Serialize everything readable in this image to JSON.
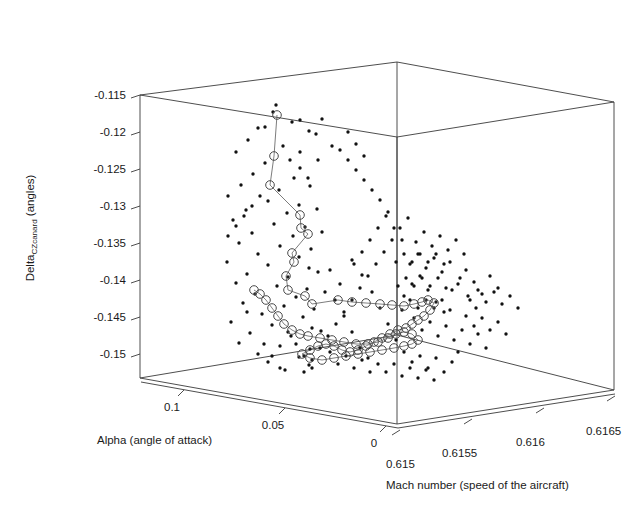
{
  "figure": {
    "kind": "3d-scatter-plot",
    "background": "#ffffff",
    "ink_color": "#1a1a1a"
  },
  "chart_data": {
    "type": "scatter",
    "title": "",
    "projection": "3d",
    "grid": false,
    "legend": null,
    "xlabel": "Alpha (angle of attack)",
    "ylabel": "Delta",
    "ylabel_sub": "CZcanard",
    "ylabel_suffix": " (angles)",
    "zlabel": "Mach number (speed of the aircraft)",
    "xticks": [
      "0.1",
      "0.05",
      "0"
    ],
    "xtick_values": [
      0.1,
      0.05,
      0
    ],
    "xlim": [
      0.1125,
      -0.0125
    ],
    "yticks": [
      "-0.115",
      "-0.12",
      "-0.125",
      "-0.13",
      "-0.135",
      "-0.14",
      "-0.145",
      "-0.15"
    ],
    "ytick_values": [
      -0.115,
      -0.12,
      -0.125,
      -0.13,
      -0.135,
      -0.14,
      -0.145,
      -0.15
    ],
    "ylim": [
      -0.1525,
      -0.1135
    ],
    "zticks": [
      "0.615",
      "0.6155",
      "0.616",
      "0.6165"
    ],
    "ztick_values": [
      0.615,
      0.6155,
      0.616,
      0.6165
    ],
    "zlim": [
      0.61488,
      0.61676
    ],
    "series": [
      {
        "name": "scatter-points",
        "marker": "small-filled-dot",
        "color": "#111111",
        "points_px": [
          [
            273,
            112
          ],
          [
            292,
            122
          ],
          [
            258,
            128
          ],
          [
            265,
            127
          ],
          [
            322,
            119
          ],
          [
            309,
            131
          ],
          [
            276,
            105
          ],
          [
            248,
            140
          ],
          [
            283,
            146
          ],
          [
            236,
            152
          ],
          [
            300,
            152
          ],
          [
            265,
            163
          ],
          [
            318,
            160
          ],
          [
            253,
            174
          ],
          [
            294,
            178
          ],
          [
            241,
            185
          ],
          [
            279,
            190
          ],
          [
            310,
            186
          ],
          [
            228,
            196
          ],
          [
            268,
            201
          ],
          [
            299,
            205
          ],
          [
            246,
            210
          ],
          [
            287,
            213
          ],
          [
            317,
            209
          ],
          [
            233,
            220
          ],
          [
            274,
            224
          ],
          [
            305,
            227
          ],
          [
            252,
            233
          ],
          [
            293,
            236
          ],
          [
            322,
            232
          ],
          [
            239,
            243
          ],
          [
            280,
            246
          ],
          [
            311,
            249
          ],
          [
            258,
            254
          ],
          [
            299,
            257
          ],
          [
            227,
            262
          ],
          [
            268,
            265
          ],
          [
            309,
            268
          ],
          [
            247,
            274
          ],
          [
            288,
            277
          ],
          [
            318,
            272
          ],
          [
            236,
            283
          ],
          [
            277,
            286
          ],
          [
            307,
            289
          ],
          [
            255,
            294
          ],
          [
            296,
            297
          ],
          [
            325,
            292
          ],
          [
            243,
            303
          ],
          [
            284,
            306
          ],
          [
            314,
            309
          ],
          [
            262,
            314
          ],
          [
            303,
            317
          ],
          [
            231,
            322
          ],
          [
            272,
            325
          ],
          [
            312,
            328
          ],
          [
            250,
            333
          ],
          [
            291,
            336
          ],
          [
            321,
            331
          ],
          [
            239,
            343
          ],
          [
            280,
            346
          ],
          [
            310,
            349
          ],
          [
            258,
            354
          ],
          [
            299,
            357
          ],
          [
            268,
            362
          ],
          [
            309,
            365
          ],
          [
            285,
            370
          ],
          [
            247,
            312
          ],
          [
            335,
            300
          ],
          [
            344,
            316
          ],
          [
            352,
            332
          ],
          [
            360,
            348
          ],
          [
            368,
            358
          ],
          [
            340,
            284
          ],
          [
            330,
            270
          ],
          [
            352,
            260
          ],
          [
            362,
            275
          ],
          [
            372,
            292
          ],
          [
            380,
            308
          ],
          [
            388,
            324
          ],
          [
            396,
            340
          ],
          [
            404,
            296
          ],
          [
            412,
            284
          ],
          [
            420,
            276
          ],
          [
            428,
            290
          ],
          [
            436,
            302
          ],
          [
            444,
            312
          ],
          [
            452,
            290
          ],
          [
            460,
            278
          ],
          [
            468,
            296
          ],
          [
            476,
            308
          ],
          [
            410,
            264
          ],
          [
            418,
            254
          ],
          [
            426,
            268
          ],
          [
            434,
            258
          ],
          [
            442,
            272
          ],
          [
            450,
            262
          ],
          [
            458,
            284
          ],
          [
            466,
            270
          ],
          [
            474,
            282
          ],
          [
            482,
            294
          ],
          [
            490,
            276
          ],
          [
            498,
            288
          ],
          [
            414,
            318
          ],
          [
            422,
            330
          ],
          [
            430,
            322
          ],
          [
            438,
            336
          ],
          [
            446,
            326
          ],
          [
            454,
            340
          ],
          [
            462,
            330
          ],
          [
            470,
            344
          ],
          [
            478,
            334
          ],
          [
            486,
            348
          ],
          [
            404,
            352
          ],
          [
            412,
            362
          ],
          [
            420,
            356
          ],
          [
            428,
            368
          ],
          [
            436,
            358
          ],
          [
            444,
            372
          ],
          [
            452,
            362
          ],
          [
            416,
            242
          ],
          [
            424,
            232
          ],
          [
            432,
            246
          ],
          [
            440,
            236
          ],
          [
            448,
            250
          ],
          [
            456,
            240
          ],
          [
            464,
            254
          ],
          [
            400,
            228
          ],
          [
            408,
            218
          ],
          [
            392,
            240
          ],
          [
            384,
            252
          ],
          [
            376,
            264
          ],
          [
            368,
            276
          ],
          [
            360,
            288
          ],
          [
            352,
            300
          ],
          [
            344,
            312
          ],
          [
            336,
            324
          ],
          [
            328,
            336
          ],
          [
            320,
            348
          ],
          [
            312,
            360
          ],
          [
            304,
            372
          ],
          [
            402,
            310
          ],
          [
            410,
            300
          ],
          [
            418,
            308
          ],
          [
            426,
            300
          ],
          [
            434,
            308
          ],
          [
            442,
            300
          ],
          [
            450,
            310
          ],
          [
            398,
            286
          ],
          [
            406,
            278
          ],
          [
            414,
            286
          ],
          [
            422,
            278
          ],
          [
            430,
            286
          ],
          [
            438,
            278
          ],
          [
            446,
            288
          ],
          [
            396,
            262
          ],
          [
            404,
            254
          ],
          [
            412,
            262
          ],
          [
            420,
            254
          ],
          [
            428,
            262
          ],
          [
            436,
            254
          ],
          [
            444,
            264
          ],
          [
            288,
            332
          ],
          [
            296,
            344
          ],
          [
            304,
            356
          ],
          [
            312,
            368
          ],
          [
            264,
            344
          ],
          [
            272,
            356
          ],
          [
            280,
            368
          ],
          [
            330,
            352
          ],
          [
            338,
            364
          ],
          [
            346,
            356
          ],
          [
            354,
            368
          ],
          [
            362,
            360
          ],
          [
            370,
            372
          ],
          [
            378,
            364
          ],
          [
            386,
            372
          ],
          [
            394,
            364
          ],
          [
            402,
            376
          ],
          [
            410,
            368
          ],
          [
            418,
            378
          ],
          [
            426,
            370
          ],
          [
            434,
            380
          ],
          [
            252,
            206
          ],
          [
            260,
            196
          ],
          [
            244,
            216
          ],
          [
            236,
            226
          ],
          [
            228,
            236
          ],
          [
            300,
            168
          ],
          [
            308,
            178
          ],
          [
            466,
            316
          ],
          [
            474,
            326
          ],
          [
            482,
            318
          ],
          [
            490,
            330
          ],
          [
            498,
            322
          ],
          [
            506,
            334
          ],
          [
            458,
            352
          ],
          [
            380,
            200
          ],
          [
            388,
            212
          ],
          [
            372,
            190
          ],
          [
            364,
            180
          ],
          [
            356,
            170
          ],
          [
            348,
            160
          ],
          [
            340,
            150
          ],
          [
            470,
            300
          ],
          [
            478,
            290
          ],
          [
            486,
            302
          ],
          [
            494,
            292
          ],
          [
            502,
            304
          ],
          [
            510,
            296
          ],
          [
            518,
            308
          ],
          [
            300,
            120
          ],
          [
            316,
            134
          ],
          [
            332,
            146
          ],
          [
            348,
            132
          ],
          [
            356,
            144
          ],
          [
            364,
            156
          ],
          [
            290,
            160
          ],
          [
            394,
            228
          ],
          [
            402,
            240
          ],
          [
            386,
            216
          ],
          [
            378,
            228
          ],
          [
            370,
            240
          ],
          [
            362,
            252
          ],
          [
            354,
            264
          ]
        ]
      },
      {
        "name": "trajectory-circles",
        "marker": "large-open-circle",
        "color": "#4a4a4a",
        "connected": true,
        "points_px": [
          [
            277,
            115
          ],
          [
            274,
            156
          ],
          [
            270,
            185
          ],
          [
            300,
            215
          ],
          [
            301,
            228
          ],
          [
            308,
            234
          ],
          [
            292,
            253
          ],
          [
            294,
            262
          ],
          [
            286,
            276
          ],
          [
            288,
            290
          ],
          [
            305,
            296
          ],
          [
            312,
            304
          ],
          [
            338,
            300
          ],
          [
            352,
            302
          ],
          [
            366,
            303
          ],
          [
            380,
            304
          ],
          [
            392,
            305
          ],
          [
            404,
            306
          ],
          [
            414,
            304
          ],
          [
            422,
            302
          ],
          [
            428,
            300
          ],
          [
            434,
            303
          ],
          [
            430,
            310
          ],
          [
            424,
            316
          ],
          [
            418,
            320
          ],
          [
            412,
            324
          ],
          [
            406,
            328
          ],
          [
            398,
            330
          ],
          [
            390,
            334
          ],
          [
            382,
            338
          ],
          [
            374,
            342
          ],
          [
            366,
            346
          ],
          [
            358,
            350
          ],
          [
            350,
            352
          ],
          [
            342,
            350
          ],
          [
            334,
            346
          ],
          [
            326,
            344
          ],
          [
            318,
            346
          ],
          [
            310,
            350
          ],
          [
            302,
            354
          ],
          [
            310,
            358
          ],
          [
            322,
            360
          ],
          [
            334,
            358
          ],
          [
            346,
            356
          ],
          [
            358,
            354
          ],
          [
            370,
            352
          ],
          [
            382,
            350
          ],
          [
            394,
            348
          ],
          [
            404,
            346
          ],
          [
            412,
            344
          ],
          [
            418,
            340
          ],
          [
            412,
            334
          ],
          [
            404,
            332
          ],
          [
            396,
            334
          ],
          [
            388,
            338
          ],
          [
            378,
            342
          ],
          [
            368,
            344
          ],
          [
            356,
            344
          ],
          [
            344,
            342
          ],
          [
            332,
            340
          ],
          [
            320,
            338
          ],
          [
            308,
            336
          ],
          [
            300,
            334
          ],
          [
            292,
            330
          ],
          [
            284,
            324
          ],
          [
            278,
            316
          ],
          [
            272,
            308
          ],
          [
            266,
            300
          ],
          [
            260,
            294
          ],
          [
            254,
            290
          ]
        ]
      }
    ]
  },
  "axes": {
    "y_label_main": "Delta",
    "y_label_subscript": "CZcanard",
    "y_label_tail": " (angles)",
    "x_label": "Alpha (angle of attack)",
    "z_label": "Mach number (speed of the aircraft)",
    "y_ticks": [
      "-0.115",
      "-0.12",
      "-0.125",
      "-0.13",
      "-0.135",
      "-0.14",
      "-0.145",
      "-0.15"
    ],
    "x_ticks": [
      "0.1",
      "0.05",
      "0"
    ],
    "z_ticks": [
      "0.615",
      "0.6155",
      "0.616",
      "0.6165"
    ]
  }
}
